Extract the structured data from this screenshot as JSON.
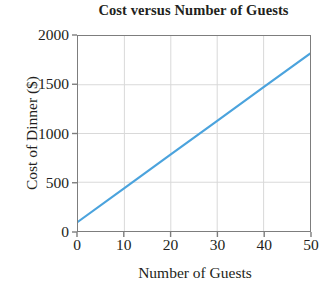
{
  "chart_data": {
    "type": "line",
    "title": "Cost versus Number of Guests",
    "xlabel": "Number of Guests",
    "ylabel": "Cost of Dinner ($)",
    "xlim": [
      0,
      50
    ],
    "ylim": [
      0,
      2000
    ],
    "xticks": [
      "0",
      "10",
      "20",
      "30",
      "40",
      "50"
    ],
    "xtick_values": [
      0,
      10,
      20,
      30,
      40,
      50
    ],
    "yticks": [
      "0",
      "500",
      "1000",
      "1500",
      "2000"
    ],
    "ytick_values": [
      0,
      500,
      1000,
      1500,
      2000
    ],
    "grid": true,
    "legend": null,
    "series": [
      {
        "name": "Cost of Dinner",
        "color": "#4ba3dd",
        "x": [
          0,
          10,
          20,
          30,
          40,
          50
        ],
        "y": [
          95,
          440,
          785,
          1130,
          1475,
          1820
        ]
      }
    ],
    "annotations": []
  },
  "axes": {
    "line_color": "#4ba3dd",
    "axis_color": "#7d7d7d",
    "grid_color": "#d9d9d9"
  }
}
